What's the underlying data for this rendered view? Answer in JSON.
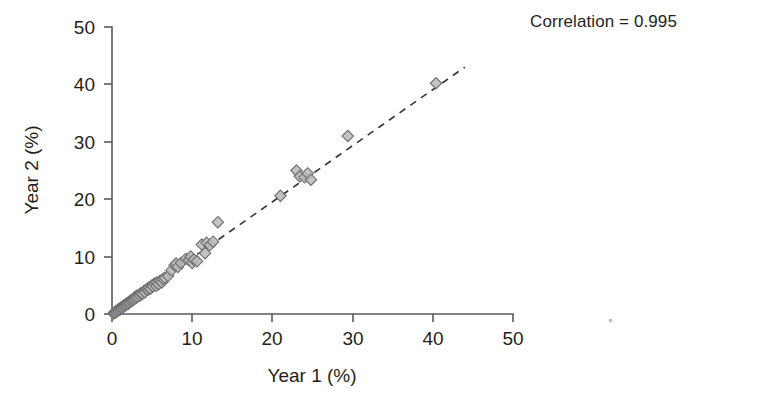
{
  "figure": {
    "width": 767,
    "height": 408,
    "background": "#ffffff"
  },
  "annotations": {
    "correlation_text": "Correlation = 0.995"
  },
  "colors": {
    "axis": "#58595b",
    "text": "#231f20",
    "marker_fill": "#b9b9b9",
    "marker_stroke": "#6d6e71",
    "fit_line": "#3a3a3a"
  },
  "chart_data": {
    "type": "scatter",
    "title": "",
    "xlabel": "Year 1 (%)",
    "ylabel": "Year 2 (%)",
    "xlim": [
      0,
      50
    ],
    "ylim": [
      0,
      50
    ],
    "xticks": [
      0,
      10,
      20,
      30,
      40,
      50
    ],
    "yticks": [
      0,
      10,
      20,
      30,
      40,
      50
    ],
    "xtick_labels": [
      "0",
      "10",
      "20",
      "30",
      "40",
      "50"
    ],
    "ytick_labels": [
      "0",
      "10",
      "20",
      "30",
      "40",
      "50"
    ],
    "grid": false,
    "legend": null,
    "annotations": [
      {
        "text": "Correlation = 0.995",
        "position": "top-right",
        "x": 0.72,
        "y": 0.95
      }
    ],
    "marker": {
      "shape": "diamond",
      "size": 9,
      "fill": "#b9b9b9",
      "edge": "#6d6e71",
      "opacity": 0.85
    },
    "fit_line": {
      "style": "dashed",
      "color": "#3a3a3a",
      "x_start": 0.0,
      "y_start": 0.0,
      "x_end": 44.0,
      "y_end": 43.0,
      "slope": 0.977,
      "intercept": 0.0
    },
    "correlation": 0.995,
    "n_points": 74,
    "series": [
      {
        "name": "Year 1 vs Year 2",
        "points": [
          [
            0.2,
            0.1
          ],
          [
            0.3,
            0.3
          ],
          [
            0.4,
            0.2
          ],
          [
            0.5,
            0.5
          ],
          [
            0.6,
            0.4
          ],
          [
            0.7,
            0.7
          ],
          [
            0.8,
            0.6
          ],
          [
            0.9,
            0.9
          ],
          [
            1.0,
            0.8
          ],
          [
            1.1,
            1.1
          ],
          [
            1.2,
            1.0
          ],
          [
            1.3,
            1.3
          ],
          [
            1.4,
            1.2
          ],
          [
            1.5,
            1.5
          ],
          [
            1.6,
            1.4
          ],
          [
            1.7,
            1.7
          ],
          [
            1.8,
            1.6
          ],
          [
            1.9,
            1.9
          ],
          [
            2.0,
            1.8
          ],
          [
            2.1,
            2.1
          ],
          [
            2.2,
            2.0
          ],
          [
            2.3,
            2.3
          ],
          [
            2.4,
            2.2
          ],
          [
            2.5,
            2.5
          ],
          [
            2.6,
            2.4
          ],
          [
            2.7,
            2.7
          ],
          [
            2.8,
            2.6
          ],
          [
            2.9,
            3.0
          ],
          [
            3.0,
            2.8
          ],
          [
            3.1,
            3.2
          ],
          [
            3.2,
            3.0
          ],
          [
            3.4,
            3.4
          ],
          [
            3.5,
            3.2
          ],
          [
            3.6,
            3.6
          ],
          [
            3.8,
            3.5
          ],
          [
            4.0,
            4.0
          ],
          [
            4.1,
            3.8
          ],
          [
            4.3,
            4.3
          ],
          [
            4.5,
            4.2
          ],
          [
            4.6,
            4.6
          ],
          [
            4.8,
            4.4
          ],
          [
            5.0,
            5.0
          ],
          [
            5.1,
            4.8
          ],
          [
            5.3,
            5.3
          ],
          [
            5.5,
            4.9
          ],
          [
            5.6,
            5.5
          ],
          [
            5.8,
            5.2
          ],
          [
            6.0,
            5.8
          ],
          [
            6.2,
            5.5
          ],
          [
            6.4,
            6.1
          ],
          [
            6.6,
            6.3
          ],
          [
            7.0,
            6.6
          ],
          [
            7.4,
            7.6
          ],
          [
            7.8,
            8.5
          ],
          [
            8.0,
            8.8
          ],
          [
            8.2,
            8.2
          ],
          [
            8.6,
            8.9
          ],
          [
            9.2,
            9.6
          ],
          [
            9.6,
            9.4
          ],
          [
            9.8,
            10.0
          ],
          [
            10.0,
            8.9
          ],
          [
            10.2,
            9.5
          ],
          [
            10.6,
            9.2
          ],
          [
            11.2,
            12.1
          ],
          [
            11.6,
            10.6
          ],
          [
            11.8,
            12.4
          ],
          [
            12.2,
            12.0
          ],
          [
            12.6,
            12.6
          ],
          [
            13.2,
            16.0
          ],
          [
            21.0,
            20.6
          ],
          [
            23.0,
            25.0
          ],
          [
            23.4,
            24.0
          ],
          [
            24.0,
            23.8
          ],
          [
            24.4,
            24.5
          ],
          [
            24.8,
            23.4
          ],
          [
            29.4,
            31.0
          ],
          [
            40.4,
            40.2
          ]
        ]
      }
    ]
  },
  "axes_geometry": {
    "origin_x_px": 112,
    "origin_y_px": 314,
    "x_scale_px_per_unit": 8.02,
    "y_scale_px_per_unit": 5.74
  }
}
